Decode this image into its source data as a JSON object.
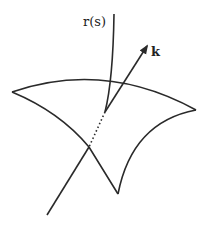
{
  "diagram": {
    "labels": {
      "curve": "r(s)",
      "vector": "k"
    },
    "colors": {
      "stroke": "#2a2a2a",
      "background": "#ffffff"
    },
    "elements": [
      {
        "id": "surface-patch",
        "type": "curved-quadrilateral",
        "corners": [
          [
            12,
            92
          ],
          [
            196,
            110
          ],
          [
            118,
            194
          ],
          [
            89,
            147
          ]
        ]
      },
      {
        "id": "curve-r-s",
        "type": "curve",
        "from": [
          114,
          14
        ],
        "to": [
          105,
          112
        ]
      },
      {
        "id": "vector-k",
        "type": "arrow",
        "from": [
          105,
          112
        ],
        "to": [
          147,
          45
        ]
      },
      {
        "id": "hidden-segment",
        "type": "dotted-line",
        "from": [
          105,
          112
        ],
        "to": [
          89,
          147
        ]
      },
      {
        "id": "incoming-line",
        "type": "line",
        "from": [
          89,
          147
        ],
        "to": [
          47,
          215
        ]
      }
    ]
  }
}
